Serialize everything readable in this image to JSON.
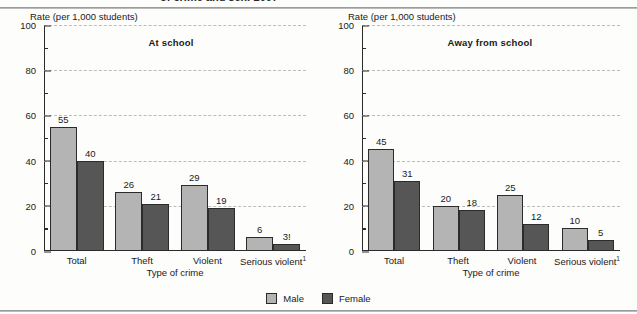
{
  "figure": {
    "cutoff_title": "of crime and sex: 2007",
    "legend": [
      {
        "label": "Male",
        "color": "#b4b4b4",
        "swatch": "male-swatch"
      },
      {
        "label": "Female",
        "color": "#565656",
        "swatch": "female-swatch"
      }
    ]
  },
  "chart_data": {
    "type": "bar",
    "title": "of crime and sex: 2007",
    "categories": [
      "Total",
      "Theft",
      "Violent",
      "Serious violent"
    ],
    "category_labels": [
      "Total",
      "Theft",
      "Violent",
      "Serious violent¹"
    ],
    "ylabel": "Rate (per 1,000 students)",
    "xlabel": "Type of crime",
    "ylim": [
      0,
      100
    ],
    "yticks": [
      0,
      20,
      40,
      60,
      80,
      100
    ],
    "ytick_labels": [
      "0",
      "20",
      "40",
      "60",
      "80",
      "100"
    ],
    "minor_yticks": [
      10,
      30,
      50,
      70,
      90
    ],
    "grid": true,
    "legend_position": "bottom-center",
    "panels": [
      {
        "name": "At school",
        "series": [
          {
            "name": "Male",
            "color": "#b4b4b4",
            "values": [
              55,
              26,
              29,
              6
            ],
            "labels": [
              "55",
              "26",
              "29",
              "6"
            ]
          },
          {
            "name": "Female",
            "color": "#565656",
            "values": [
              40,
              21,
              19,
              3
            ],
            "labels": [
              "40",
              "21",
              "19",
              "3!"
            ]
          }
        ]
      },
      {
        "name": "Away from school",
        "series": [
          {
            "name": "Male",
            "color": "#b4b4b4",
            "values": [
              45,
              20,
              25,
              10
            ],
            "labels": [
              "45",
              "20",
              "25",
              "10"
            ]
          },
          {
            "name": "Female",
            "color": "#565656",
            "values": [
              31,
              18,
              12,
              5
            ],
            "labels": [
              "31",
              "18",
              "12",
              "5"
            ]
          }
        ]
      }
    ]
  }
}
